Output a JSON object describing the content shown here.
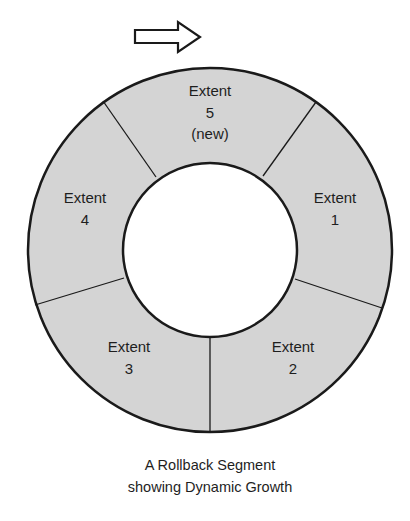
{
  "diagram": {
    "direction_arrow": {
      "icon": "right-arrow-icon",
      "meaning": "clockwise growth direction"
    },
    "ring": {
      "fill_color": "#d4d4d4",
      "stroke_color": "#1a1a1a",
      "hole_color": "#ffffff"
    },
    "extents": [
      {
        "id": "extent-5",
        "lines": [
          "Extent",
          "5",
          "(new)"
        ]
      },
      {
        "id": "extent-1",
        "lines": [
          "Extent",
          "1"
        ]
      },
      {
        "id": "extent-2",
        "lines": [
          "Extent",
          "2"
        ]
      },
      {
        "id": "extent-3",
        "lines": [
          "Extent",
          "3"
        ]
      },
      {
        "id": "extent-4",
        "lines": [
          "Extent",
          "4"
        ]
      }
    ],
    "caption": [
      "A Rollback Segment",
      "showing Dynamic Growth"
    ]
  }
}
